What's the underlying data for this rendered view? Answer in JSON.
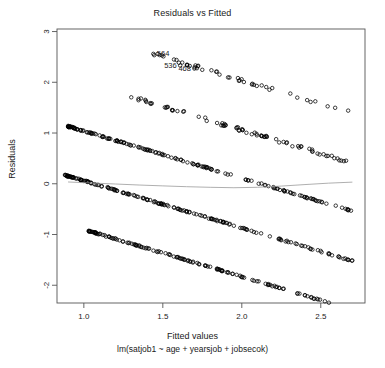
{
  "chart_data": {
    "type": "scatter",
    "title": "Residuals vs Fitted",
    "xlabel": "Fitted values",
    "sublabel": "lm(satjob1 ~ age + yearsjob + jobsecok)",
    "ylabel": "Residuals",
    "xlim": [
      0.83,
      2.78
    ],
    "ylim": [
      -2.35,
      3.05
    ],
    "xticks": [
      1.0,
      1.5,
      2.0,
      2.5
    ],
    "xtick_labels": [
      "1.0",
      "1.5",
      "2.0",
      "2.5"
    ],
    "yticks": [
      3,
      2,
      1,
      0,
      -1,
      -2
    ],
    "ytick_labels": [
      "3",
      "2",
      "1",
      "0",
      "-1",
      "-2"
    ],
    "grid": false,
    "legend": null,
    "point_marker": "open-circle",
    "point_color": "#000000",
    "smoother_color": "#9a9a9a",
    "box_color": "#555555",
    "annotations": [
      {
        "label": "564",
        "x": 1.44,
        "y": 2.56,
        "anchor": "left"
      },
      {
        "label": "536",
        "x": 1.61,
        "y": 2.33,
        "anchor": "right"
      },
      {
        "label": "468",
        "x": 1.7,
        "y": 2.27,
        "anchor": "right"
      }
    ],
    "series": [
      {
        "name": "band-1",
        "comment": "uppermost diagonal band, residual ~ 3 - 0.93*x scatter",
        "intercept": 3.9,
        "slope": -0.93,
        "x_start": 1.44,
        "x_end": 2.7,
        "n": 46,
        "density": "sparse"
      },
      {
        "name": "band-2",
        "intercept": 2.92,
        "slope": -0.93,
        "x_start": 1.3,
        "x_end": 2.7,
        "n": 78,
        "density": "medium"
      },
      {
        "name": "band-3",
        "intercept": 1.97,
        "slope": -0.93,
        "x_start": 0.9,
        "x_end": 2.7,
        "n": 170,
        "density": "dense"
      },
      {
        "name": "band-4",
        "intercept": 0.99,
        "slope": -0.93,
        "x_start": 0.88,
        "x_end": 2.7,
        "n": 180,
        "density": "dense"
      },
      {
        "name": "band-5",
        "intercept": 0.03,
        "slope": -0.93,
        "x_start": 1.03,
        "x_end": 2.7,
        "n": 150,
        "density": "dense"
      }
    ],
    "smoother": {
      "name": "loess-smoother",
      "x": [
        0.9,
        1.05,
        1.2,
        1.35,
        1.5,
        1.65,
        1.8,
        1.95,
        2.1,
        2.25,
        2.4,
        2.55,
        2.7
      ],
      "y": [
        0.035,
        0.015,
        -0.005,
        -0.025,
        -0.042,
        -0.058,
        -0.07,
        -0.078,
        -0.07,
        -0.046,
        -0.016,
        0.012,
        0.032
      ]
    }
  }
}
